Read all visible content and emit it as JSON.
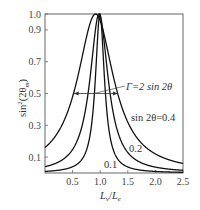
{
  "chart_data": {
    "type": "line",
    "title": "",
    "xlabel": "L_v/L_e",
    "ylabel": "sin^2(2θ_m)",
    "xlim": [
      0,
      2.5
    ],
    "ylim": [
      0,
      1.0
    ],
    "xticks": [
      0.5,
      1.0,
      1.5,
      2.0,
      2.5
    ],
    "xtick_labels": [
      "0.5",
      "1.0",
      "1.5",
      "2.0",
      "2.5"
    ],
    "yticks": [
      0.1,
      0.3,
      0.5,
      0.7,
      0.9,
      1.0
    ],
    "ytick_labels": [
      "0.1",
      "0.3",
      "0.5",
      "0.7",
      "0.9",
      "1.0"
    ],
    "grid": false,
    "legend": "none (curves labeled inline)",
    "series": [
      {
        "name": "sin 2θ=0.4",
        "label": "sin 2θ=0.4",
        "x": [
          0,
          0.25,
          0.5,
          0.6,
          0.7,
          0.8,
          0.9165,
          1.0,
          1.1,
          1.2,
          1.3,
          1.5,
          1.75,
          2.0,
          2.25,
          2.5
        ],
        "y": [
          0.16,
          0.265,
          0.48,
          0.615,
          0.773,
          0.922,
          1.0,
          0.958,
          0.826,
          0.666,
          0.521,
          0.32,
          0.187,
          0.12,
          0.083,
          0.06
        ]
      },
      {
        "name": "sin 2θ=0.2",
        "label": "0.2",
        "x": [
          0,
          0.25,
          0.5,
          0.6,
          0.7,
          0.8,
          0.9,
          0.98,
          1.05,
          1.1,
          1.2,
          1.3,
          1.5,
          1.75,
          2.0,
          2.5
        ],
        "y": [
          0.04,
          0.07,
          0.148,
          0.217,
          0.338,
          0.553,
          0.863,
          1.0,
          0.89,
          0.735,
          0.452,
          0.281,
          0.129,
          0.063,
          0.037,
          0.017
        ]
      },
      {
        "name": "sin 2θ=0.1",
        "label": "0.1",
        "x": [
          0,
          0.25,
          0.5,
          0.7,
          0.8,
          0.9,
          0.95,
          0.995,
          1.05,
          1.1,
          1.2,
          1.3,
          1.5,
          2.0,
          2.5
        ],
        "y": [
          0.01,
          0.018,
          0.039,
          0.103,
          0.208,
          0.526,
          0.832,
          1.0,
          0.768,
          0.476,
          0.192,
          0.097,
          0.038,
          0.0098,
          0.0044
        ]
      }
    ],
    "annotations": [
      {
        "text": "Γ=2 sin 2θ",
        "type": "double-arrow FWHM",
        "x_from": 0.52,
        "x_to": 1.32,
        "y": 0.5
      },
      {
        "text": "sin 2θ=0.4",
        "x": 1.55,
        "y": 0.4
      },
      {
        "text": "0.2",
        "x": 1.4,
        "y": 0.24
      },
      {
        "text": "0.1",
        "x": 0.85,
        "y": 0.1
      }
    ]
  },
  "labels": {
    "ylabel_main": "sin",
    "ylabel_sup": "2",
    "ylabel_arg": "(2θ",
    "ylabel_sub": "m",
    "ylabel_close": ")",
    "xlabel_L1": "L",
    "xlabel_sub1": "v",
    "xlabel_slash": "/",
    "xlabel_L2": "L",
    "xlabel_sub2": "e",
    "gamma_text": "Γ=2 sin 2θ",
    "curve_04": "sin 2θ=0.4",
    "curve_02": "0.2",
    "curve_01": "0.1"
  },
  "style": {
    "line_color": "#111111",
    "axis_color": "#555555",
    "text_color": "#444444"
  }
}
